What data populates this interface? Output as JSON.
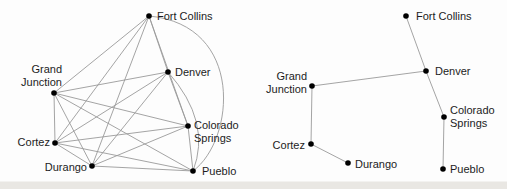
{
  "figure": {
    "colors": {
      "background": "#fdfdfd",
      "edge": "#9a9a9a",
      "node": "#000000",
      "label": "#1c1c1c",
      "scan_edge": "#e9e7e3"
    },
    "node_radius": 2.8,
    "edge_width": 0.9,
    "graphs": [
      {
        "name": "complete-graph",
        "nodes": [
          {
            "id": "fort-collins",
            "x": 149,
            "y": 16,
            "label": {
              "lines": [
                "Fort Collins"
              ],
              "anchor": "start",
              "dx": 8,
              "dys": [
                4
              ]
            }
          },
          {
            "id": "denver",
            "x": 168,
            "y": 72,
            "label": {
              "lines": [
                "Denver"
              ],
              "anchor": "start",
              "dx": 7,
              "dys": [
                4
              ]
            }
          },
          {
            "id": "grand-junction",
            "x": 54,
            "y": 93,
            "label": {
              "lines": [
                "Grand",
                "Junction"
              ],
              "anchor": "end",
              "dx": 8,
              "dys": [
                -20,
                -7
              ]
            }
          },
          {
            "id": "cortez",
            "x": 55,
            "y": 143,
            "label": {
              "lines": [
                "Cortez"
              ],
              "anchor": "end",
              "dx": -5,
              "dys": [
                3
              ]
            }
          },
          {
            "id": "durango",
            "x": 92,
            "y": 166,
            "label": {
              "lines": [
                "Durango"
              ],
              "anchor": "end",
              "dx": -5,
              "dys": [
                5
              ]
            }
          },
          {
            "id": "colorado-springs",
            "x": 188,
            "y": 126,
            "label": {
              "lines": [
                "Colorado",
                "Springs"
              ],
              "anchor": "start",
              "dx": 6,
              "dys": [
                3,
                16
              ]
            }
          },
          {
            "id": "pueblo",
            "x": 193,
            "y": 171,
            "label": {
              "lines": [
                "Pueblo"
              ],
              "anchor": "start",
              "dx": 9,
              "dys": [
                4
              ]
            }
          }
        ],
        "edges": [
          {
            "from": "fort-collins",
            "to": "denver"
          },
          {
            "from": "fort-collins",
            "to": "grand-junction"
          },
          {
            "from": "fort-collins",
            "to": "cortez"
          },
          {
            "from": "fort-collins",
            "to": "durango"
          },
          {
            "from": "fort-collins",
            "to": "colorado-springs"
          },
          {
            "from": "fort-collins",
            "to": "pueblo",
            "c": [
              245,
              25,
              235,
              140
            ]
          },
          {
            "from": "denver",
            "to": "grand-junction"
          },
          {
            "from": "denver",
            "to": "cortez"
          },
          {
            "from": "denver",
            "to": "durango"
          },
          {
            "from": "denver",
            "to": "colorado-springs"
          },
          {
            "from": "denver",
            "to": "pueblo",
            "q": [
              212,
              122
            ]
          },
          {
            "from": "grand-junction",
            "to": "cortez"
          },
          {
            "from": "grand-junction",
            "to": "durango"
          },
          {
            "from": "grand-junction",
            "to": "colorado-springs"
          },
          {
            "from": "grand-junction",
            "to": "pueblo"
          },
          {
            "from": "cortez",
            "to": "durango"
          },
          {
            "from": "cortez",
            "to": "colorado-springs"
          },
          {
            "from": "cortez",
            "to": "pueblo"
          },
          {
            "from": "durango",
            "to": "colorado-springs"
          },
          {
            "from": "durango",
            "to": "pueblo"
          },
          {
            "from": "colorado-springs",
            "to": "pueblo"
          }
        ]
      },
      {
        "name": "spanning-tree-graph",
        "nodes": [
          {
            "id": "fort-collins",
            "x": 406,
            "y": 16,
            "label": {
              "lines": [
                "Fort Collins"
              ],
              "anchor": "start",
              "dx": 10,
              "dys": [
                4
              ]
            }
          },
          {
            "id": "denver",
            "x": 426,
            "y": 71,
            "label": {
              "lines": [
                "Denver"
              ],
              "anchor": "start",
              "dx": 9,
              "dys": [
                4
              ]
            }
          },
          {
            "id": "grand-junction",
            "x": 312,
            "y": 86,
            "label": {
              "lines": [
                "Grand",
                "Junction"
              ],
              "anchor": "end",
              "dx": -5,
              "dys": [
                -6,
                7
              ]
            }
          },
          {
            "id": "cortez",
            "x": 311,
            "y": 144,
            "label": {
              "lines": [
                "Cortez"
              ],
              "anchor": "end",
              "dx": -6,
              "dys": [
                5
              ]
            }
          },
          {
            "id": "durango",
            "x": 348,
            "y": 163,
            "label": {
              "lines": [
                "Durango"
              ],
              "anchor": "start",
              "dx": 7,
              "dys": [
                5
              ]
            }
          },
          {
            "id": "colorado-springs",
            "x": 444,
            "y": 117,
            "label": {
              "lines": [
                "Colorado",
                "Springs"
              ],
              "anchor": "start",
              "dx": 6,
              "dys": [
                -3,
                10
              ]
            }
          },
          {
            "id": "pueblo",
            "x": 443,
            "y": 169,
            "label": {
              "lines": [
                "Pueblo"
              ],
              "anchor": "start",
              "dx": 7,
              "dys": [
                4
              ]
            }
          }
        ],
        "edges": [
          {
            "from": "fort-collins",
            "to": "denver"
          },
          {
            "from": "grand-junction",
            "to": "denver"
          },
          {
            "from": "denver",
            "to": "colorado-springs"
          },
          {
            "from": "colorado-springs",
            "to": "pueblo"
          },
          {
            "from": "grand-junction",
            "to": "cortez"
          },
          {
            "from": "cortez",
            "to": "durango"
          }
        ]
      }
    ]
  }
}
